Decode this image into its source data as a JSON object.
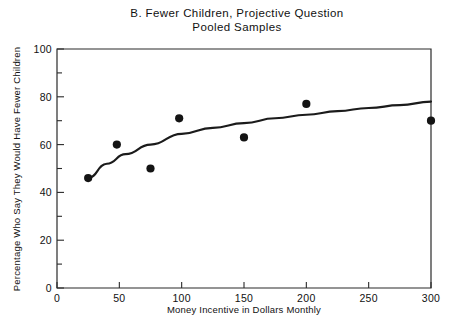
{
  "chart_data": {
    "type": "scatter",
    "title": "B. Fewer Children, Projective Question",
    "subtitle": "Pooled Samples",
    "title_line1": "B. Fewer Children, Projective Question",
    "title_line2": "Pooled Samples",
    "xlabel": "Money Incentive in Dollars Monthly",
    "ylabel": "Percentage Who Say They Would Have Fewer Children",
    "xlim": [
      0,
      300
    ],
    "ylim": [
      0,
      100
    ],
    "xticks": [
      0,
      50,
      100,
      150,
      200,
      250,
      300
    ],
    "xtick_labels": [
      "0",
      "50",
      "100",
      "150",
      "200",
      "250",
      "300"
    ],
    "yticks": [
      0,
      20,
      40,
      60,
      80,
      100
    ],
    "ytick_labels": [
      "0",
      "20",
      "40",
      "60",
      "80",
      "100"
    ],
    "y_minor_ticks": [
      10,
      30,
      50,
      70,
      90
    ],
    "grid": false,
    "legend": "none",
    "marker": "filled-circle",
    "points": [
      {
        "x": 25,
        "y": 46
      },
      {
        "x": 48,
        "y": 60
      },
      {
        "x": 75,
        "y": 50
      },
      {
        "x": 98,
        "y": 71
      },
      {
        "x": 150,
        "y": 63
      },
      {
        "x": 200,
        "y": 77
      },
      {
        "x": 300,
        "y": 70
      }
    ],
    "fit_line": {
      "name": "fitted curve",
      "points": [
        {
          "x": 25,
          "y": 46
        },
        {
          "x": 40,
          "y": 52
        },
        {
          "x": 55,
          "y": 56
        },
        {
          "x": 75,
          "y": 60
        },
        {
          "x": 100,
          "y": 64.5
        },
        {
          "x": 125,
          "y": 67
        },
        {
          "x": 150,
          "y": 69
        },
        {
          "x": 175,
          "y": 71
        },
        {
          "x": 200,
          "y": 72.5
        },
        {
          "x": 225,
          "y": 74
        },
        {
          "x": 250,
          "y": 75.3
        },
        {
          "x": 275,
          "y": 76.5
        },
        {
          "x": 300,
          "y": 78
        }
      ]
    },
    "colors": {
      "marker": "#141414",
      "curve": "#1b1b1b",
      "axis": "#2a2a2a",
      "background": "#ffffff"
    }
  }
}
